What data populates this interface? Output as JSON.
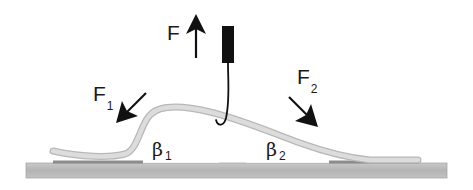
{
  "figure": {
    "labels": {
      "applied_force": "F",
      "left_force_main": "F",
      "left_force_sub": "1",
      "right_force_main": "F",
      "right_force_sub": "2",
      "left_angle_main": "β",
      "left_angle_sub": "1",
      "right_angle_main": "β",
      "right_angle_sub": "2"
    },
    "colors": {
      "ink": "#1a1a1a",
      "substrate": "#bdbdbd",
      "substrate_edge": "#9a9a9a",
      "adhesive": "#8c8c8c",
      "strip": "#d4d4d4",
      "strip_edge": "#b8b8b8",
      "probe": "#111111",
      "background": "#ffffff"
    },
    "elements": {
      "substrate": "substrate",
      "probe": "probe",
      "hook": "hook",
      "strip": "peeled-strip",
      "arrows": [
        "force-arrow-up",
        "force-arrow-left",
        "force-arrow-right"
      ]
    }
  }
}
